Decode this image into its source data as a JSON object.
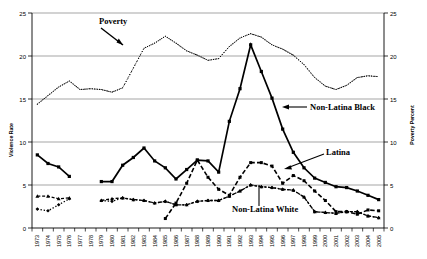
{
  "chart_data": {
    "type": "line",
    "title": "",
    "xlabel": "",
    "ylabel": "Violence Rate",
    "y2label": "Poverty Percent",
    "ylim": [
      0,
      25
    ],
    "y2lim": [
      0,
      25
    ],
    "yticks": [
      0,
      5,
      10,
      15,
      20,
      25
    ],
    "y2ticks": [
      0,
      5,
      10,
      15,
      20,
      25
    ],
    "grid": "horizontal",
    "legend_position": "inline-annotations",
    "categories": [
      "1973",
      "1974",
      "1975",
      "1976",
      "1977",
      "1978",
      "1979",
      "1980",
      "1981",
      "1982",
      "1983",
      "1984",
      "1985",
      "1986",
      "1987",
      "1988",
      "1989",
      "1990",
      "1991",
      "1992",
      "1993",
      "1994",
      "1995",
      "1996",
      "1997",
      "1998",
      "1999",
      "2000",
      "2001",
      "2002",
      "2003",
      "2004",
      "2005"
    ],
    "series": [
      {
        "name": "Poverty",
        "axis": "right",
        "style": "dotted",
        "values": [
          14.4,
          15.4,
          16.4,
          17.1,
          16.1,
          16.2,
          16.1,
          15.8,
          16.3,
          18.6,
          20.9,
          21.5,
          22.3,
          21.5,
          20.6,
          20.1,
          19.5,
          19.7,
          21.1,
          22.1,
          22.6,
          22.2,
          21.3,
          20.8,
          20.1,
          19.0,
          17.5,
          16.5,
          16.1,
          16.6,
          17.5,
          17.7,
          17.6
        ]
      },
      {
        "name": "Non-Latina Black",
        "axis": "left",
        "style": "solid",
        "values": [
          8.5,
          7.5,
          7.1,
          6.0,
          null,
          null,
          5.4,
          5.4,
          7.3,
          8.2,
          9.3,
          7.8,
          7.0,
          5.7,
          6.8,
          7.9,
          7.8,
          6.5,
          12.4,
          16.2,
          21.3,
          18.2,
          15.1,
          11.5,
          8.8,
          7.0,
          5.8,
          5.3,
          4.8,
          4.7,
          4.3,
          3.8,
          3.3
        ]
      },
      {
        "name": "Latina",
        "axis": "left",
        "style": "dashed",
        "values": [
          null,
          null,
          null,
          null,
          null,
          null,
          null,
          null,
          null,
          null,
          null,
          null,
          1.1,
          2.9,
          5.2,
          7.9,
          5.9,
          4.5,
          3.8,
          5.9,
          7.6,
          7.6,
          7.2,
          5.2,
          6.1,
          5.5,
          4.3,
          3.2,
          1.9,
          1.9,
          1.6,
          2.1,
          2.0
        ]
      },
      {
        "name": "Non-Latina White",
        "axis": "left",
        "style": "dotted-marker",
        "values": [
          2.2,
          2.0,
          2.7,
          3.4,
          null,
          null,
          3.2,
          3.1,
          3.5,
          3.3,
          3.2,
          2.9,
          3.1,
          2.7,
          2.7,
          3.1,
          3.2,
          3.2,
          3.7,
          4.3,
          5.0,
          4.8,
          4.7,
          4.5,
          4.4,
          3.6,
          1.9,
          1.8,
          1.7,
          1.9,
          1.9,
          1.4,
          1.2
        ]
      },
      {
        "name": "Non-Latina White upper",
        "axis": "left",
        "style": "dash-upper",
        "values": [
          3.7,
          3.7,
          3.4,
          3.5,
          null,
          null,
          3.2,
          3.4,
          3.5,
          3.3,
          3.2,
          2.9,
          3.1,
          2.7,
          2.7,
          3.1,
          3.2,
          3.2,
          3.7,
          4.3,
          5.0,
          4.8,
          4.7,
          4.5,
          4.4,
          3.6,
          1.9,
          1.8,
          1.7,
          1.9,
          1.9,
          1.4,
          1.2
        ]
      }
    ],
    "annotations": [
      {
        "text": "Poverty",
        "name": "poverty-label"
      },
      {
        "text": "Non-Latina Black",
        "name": "non-latina-black-label"
      },
      {
        "text": "Latina",
        "name": "latina-label"
      },
      {
        "text": "Non-Latina White",
        "name": "non-latina-white-label"
      }
    ]
  }
}
